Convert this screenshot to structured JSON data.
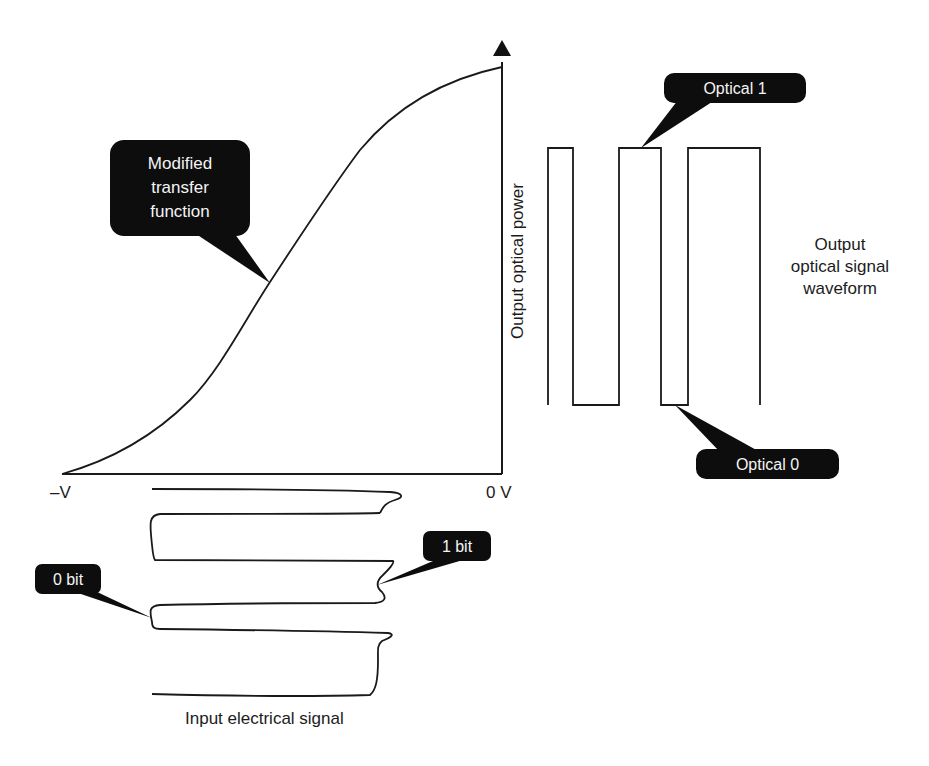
{
  "diagram": {
    "transfer_curve": {
      "callout_label": [
        "Modified",
        "transfer",
        "function"
      ],
      "callout_text": "Modified transfer function"
    },
    "axes": {
      "y_label": "Output optical power",
      "x_min_label": "–V",
      "x_max_label": "0 V"
    },
    "output_waveform": {
      "label_lines": [
        "Output",
        "optical signal",
        "waveform"
      ],
      "optical_1_label": "Optical 1",
      "optical_0_label": "Optical 0",
      "bit_sequence": [
        1,
        0,
        1,
        0,
        1
      ]
    },
    "input_signal": {
      "caption": "Input electrical signal",
      "one_bit_label": "1 bit",
      "zero_bit_label": "0 bit",
      "bit_sequence": [
        1,
        0,
        1,
        0,
        1
      ]
    },
    "colors": {
      "line": "#1a1a1a",
      "callout_bg": "#0d0d0d",
      "callout_text": "#f4f4f4",
      "background": "#ffffff"
    }
  }
}
